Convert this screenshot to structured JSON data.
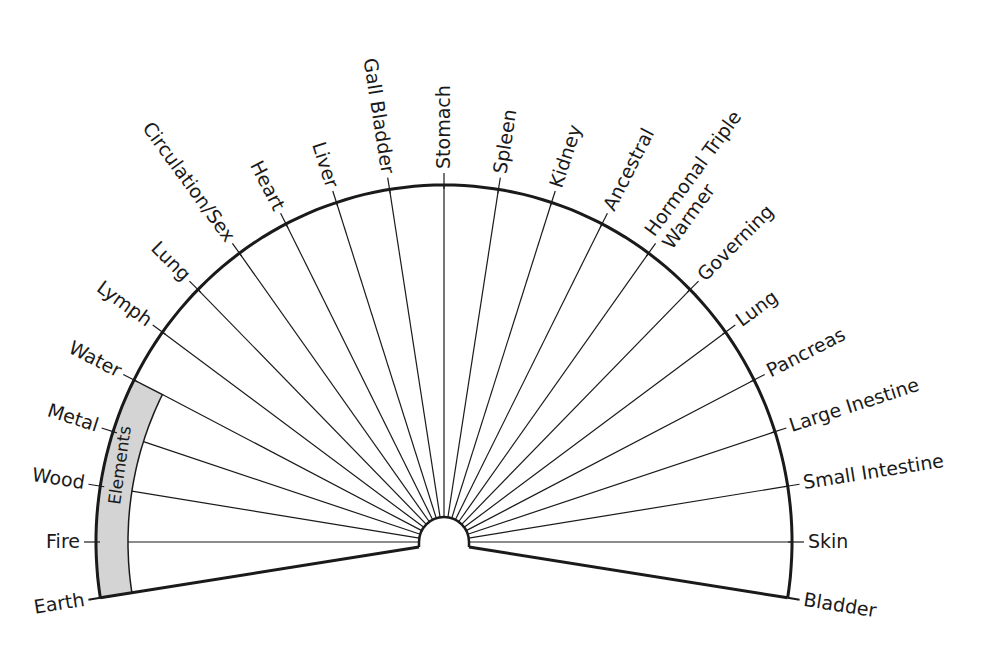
{
  "diagram": {
    "type": "semicircle-pendulum-chart",
    "colors": {
      "line": "#1a1a1a",
      "band_fill": "#d4d4d4",
      "background": "#ffffff"
    },
    "band_label": "Elements",
    "spoke_labels": [
      "Fire",
      "Wood",
      "Metal",
      "Water",
      "Lymph",
      "Lung",
      "Circulation/Sex",
      "Heart",
      "Liver",
      "Gall Bladder",
      "Stomach",
      "Spleen",
      "Kidney",
      "Ancestral",
      "Hormonal Triple Warmer",
      "Governing",
      "Lung",
      "Pancreas",
      "Large Inestine",
      "Small Intestine",
      "Skin"
    ],
    "end_labels": {
      "left": "Earth",
      "right": "Bladder"
    },
    "band_spokes": [
      "Water",
      "Metal",
      "Wood",
      "Fire"
    ]
  },
  "chart_data": {
    "type": "table",
    "title": "",
    "spoke_count": 21,
    "angle_step_deg": 9,
    "angles_deg": [
      180,
      171,
      162,
      153,
      144,
      135,
      126,
      117,
      108,
      99,
      90,
      81,
      72,
      63,
      54,
      45,
      36,
      27,
      18,
      9,
      0
    ],
    "left_sector_label": "Elements",
    "left_sector_items": [
      "Water",
      "Metal",
      "Wood",
      "Fire",
      "Earth"
    ],
    "organ_items": [
      "Lymph",
      "Lung",
      "Circulation/Sex",
      "Heart",
      "Liver",
      "Gall Bladder",
      "Stomach",
      "Spleen",
      "Kidney",
      "Ancestral",
      "Hormonal Triple Warmer",
      "Governing",
      "Lung",
      "Pancreas",
      "Large Inestine",
      "Small Intestine",
      "Skin",
      "Bladder"
    ]
  }
}
